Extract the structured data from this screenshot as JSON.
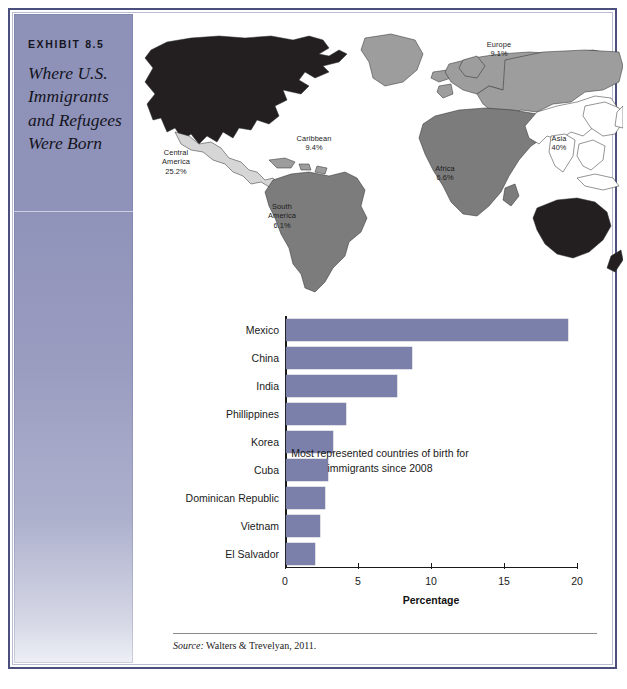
{
  "exhibit": {
    "label": "EXHIBIT 8.5",
    "title": "Where U.S. Immigrants and Refugees Were Born"
  },
  "map": {
    "name": "world-map",
    "regions": [
      {
        "name": "north-america",
        "label": "",
        "value": "",
        "shade": "darkest"
      },
      {
        "name": "central-america",
        "label": "Central America",
        "value": "25.2%",
        "shade": "lightest"
      },
      {
        "name": "caribbean",
        "label": "Caribbean",
        "value": "9.4%",
        "shade": "medium"
      },
      {
        "name": "south-america",
        "label": "South America",
        "value": "6.1%",
        "shade": "medium-dark"
      },
      {
        "name": "europe",
        "label": "Europe",
        "value": "9.1%",
        "shade": "medium"
      },
      {
        "name": "africa",
        "label": "Africa",
        "value": "6.6%",
        "shade": "medium-dark"
      },
      {
        "name": "asia",
        "label": "Asia",
        "value": "40%",
        "shade": "outline"
      }
    ],
    "labels": {
      "caribbean": "Caribbean\n9.4%",
      "central_america": "Central\nAmerica\n25.2%",
      "south_america": "South\nAmerica\n6.1%",
      "europe": "Europe\n9.1%",
      "africa": "Africa\n6.6%",
      "asia": "Asia\n40%"
    }
  },
  "chart_data": {
    "type": "bar",
    "orientation": "horizontal",
    "title": "",
    "xlabel": "Percentage",
    "ylabel": "",
    "xlim": [
      0,
      20
    ],
    "xticks": [
      0,
      5,
      10,
      15,
      20
    ],
    "xtick_labels": [
      "0",
      "5",
      "10",
      "15",
      "20"
    ],
    "grid": false,
    "legend": null,
    "bar_color": "#7b80ab",
    "categories": [
      "Mexico",
      "China",
      "India",
      "Phillippines",
      "Korea",
      "Cuba",
      "Dominican Republic",
      "Vietnam",
      "El Salvador"
    ],
    "values": [
      19.3,
      8.6,
      7.6,
      4.1,
      3.2,
      2.85,
      2.7,
      2.35,
      2.0
    ],
    "annotation": "Most represented countries of birth for immigrants since 2008"
  },
  "source": {
    "keyword": "Source:",
    "text": " Walters & Trevelyan, 2011."
  },
  "colors": {
    "sidebar_top": "#8e92b8",
    "sidebar_bottom": "#eef0f6",
    "frame": "#4a4f7e",
    "bar": "#7b80ab",
    "map_darkest": "#231f20",
    "map_medium_dark": "#7c7c7c",
    "map_medium": "#9d9d9d",
    "map_lightest": "#d6d6d6"
  }
}
